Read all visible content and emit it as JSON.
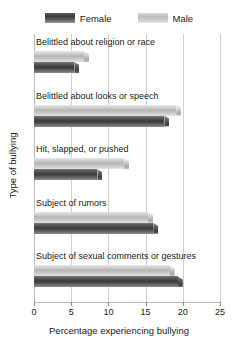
{
  "legend": {
    "entries": [
      {
        "label": "Female",
        "color": "#3c3c3c",
        "swatch_name": "female-swatch"
      },
      {
        "label": "Male",
        "color": "#bdbdbd",
        "swatch_name": "male-swatch"
      }
    ]
  },
  "axes": {
    "x_title": "Percentage experiencing bullying",
    "y_title": "Type of bullying",
    "x_ticks": [
      "0",
      "5",
      "10",
      "15",
      "20",
      "25"
    ]
  },
  "chart_data": {
    "type": "bar",
    "orientation": "horizontal",
    "title": "",
    "xlabel": "Percentage experiencing bullying",
    "ylabel": "Type of bullying",
    "xlim": [
      0,
      25
    ],
    "xticks": [
      0,
      5,
      10,
      15,
      20,
      25
    ],
    "grid": true,
    "legend_position": "top-center",
    "categories": [
      "Belittled about religion or race",
      "Belittled about looks or speech",
      "Hit, slapped, or pushed",
      "Subject of rumors",
      "Subject of sexual comments or gestures"
    ],
    "series": [
      {
        "name": "Female",
        "color": "#3c3c3c",
        "values": [
          6.1,
          18.2,
          9.2,
          16.7,
          20.0
        ]
      },
      {
        "name": "Male",
        "color": "#bdbdbd",
        "values": [
          7.4,
          19.8,
          12.8,
          16.0,
          18.9
        ]
      }
    ]
  }
}
